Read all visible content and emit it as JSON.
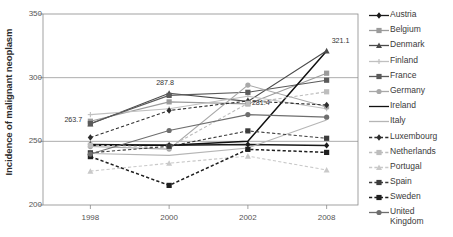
{
  "chart_data": {
    "type": "line",
    "title": "",
    "xlabel": "",
    "ylabel": "Incidence of malignant neoplasm",
    "categories": [
      "1998",
      "2000",
      "2002",
      "2008"
    ],
    "x_tick_labels": [
      "1998",
      "2000",
      "2002",
      "2008"
    ],
    "y_tick_labels": [
      "200",
      "250",
      "300",
      "350"
    ],
    "y_ticks": [
      200,
      250,
      300,
      350
    ],
    "ylim": [
      200,
      350
    ],
    "grid": true,
    "legend_position": "right",
    "annotations": [
      {
        "text": "263.7",
        "series": "Denmark",
        "x": "1998",
        "value": 263.7
      },
      {
        "text": "287.8",
        "series": "Denmark",
        "x": "2000",
        "value": 287.8
      },
      {
        "text": "281.4",
        "series": "Denmark",
        "x": "2002",
        "value": 281.4
      },
      {
        "text": "321.1",
        "series": "Denmark",
        "x": "2008",
        "value": 321.1
      }
    ],
    "series": [
      {
        "name": "Austria",
        "marker": "diamond",
        "dash": "solid",
        "color": "#1a1a1a",
        "values": [
          247.5,
          247.0,
          247.6,
          246.8
        ]
      },
      {
        "name": "Belgium",
        "marker": "square",
        "dash": "solid",
        "color": "#9b9b9b",
        "values": [
          265.8,
          281.0,
          279.4,
          303.5
        ]
      },
      {
        "name": "Denmark",
        "marker": "triangle",
        "dash": "solid",
        "color": "#4a4a4a",
        "values": [
          263.7,
          287.8,
          281.4,
          321.1
        ]
      },
      {
        "name": "Finland",
        "marker": "plus",
        "dash": "solid",
        "color": "#c0c0c0",
        "values": [
          271.0,
          275.6,
          285.4,
          275.6
        ]
      },
      {
        "name": "France",
        "marker": "square",
        "dash": "solid",
        "color": "#5a5a5a",
        "values": [
          264.0,
          286.1,
          288.5,
          298.0
        ]
      },
      {
        "name": "Germany",
        "marker": "circle",
        "dash": "solid",
        "color": "#a8a8a8",
        "values": [
          245.9,
          243.9,
          294.2,
          277.0
        ]
      },
      {
        "name": "Ireland",
        "marker": "none",
        "dash": "solid",
        "color": "#111111",
        "values": [
          247.0,
          247.0,
          250.0,
          321.0
        ]
      },
      {
        "name": "Italy",
        "marker": "none",
        "dash": "solid",
        "color": "#b5b5b5",
        "values": [
          240.5,
          239.0,
          244.8,
          266.8
        ]
      },
      {
        "name": "Luxembourg",
        "marker": "diamond",
        "dash": "dashed",
        "color": "#2e2e2e",
        "values": [
          253.0,
          274.2,
          281.7,
          278.5
        ]
      },
      {
        "name": "Netherlands",
        "marker": "square",
        "dash": "dashed",
        "color": "#bdbdbd",
        "values": [
          247.0,
          245.4,
          279.9,
          288.9
        ]
      },
      {
        "name": "Portugal",
        "marker": "triangle",
        "dash": "dashed",
        "color": "#c9c9c9",
        "values": [
          226.6,
          232.8,
          238.4,
          227.5
        ]
      },
      {
        "name": "Spain",
        "marker": "square",
        "dash": "dashed",
        "color": "#3c3c3c",
        "values": [
          241.0,
          246.1,
          258.2,
          252.4
        ]
      },
      {
        "name": "Sweden",
        "marker": "square",
        "dash": "dashed",
        "color": "#1f1f1f",
        "values": [
          238.0,
          215.4,
          243.7,
          241.3
        ]
      },
      {
        "name": "United Kingdom",
        "marker": "circle",
        "dash": "solid",
        "color": "#6e6e6e",
        "values": [
          240.0,
          258.5,
          271.0,
          269.0
        ]
      }
    ]
  },
  "legend": {
    "items": [
      {
        "label": "Austria"
      },
      {
        "label": "Belgium"
      },
      {
        "label": "Denmark"
      },
      {
        "label": "Finland"
      },
      {
        "label": "France"
      },
      {
        "label": "Germany"
      },
      {
        "label": "Ireland"
      },
      {
        "label": "Italy"
      },
      {
        "label": "Luxembourg"
      },
      {
        "label": "Netherlands"
      },
      {
        "label": "Portugal"
      },
      {
        "label": "Spain"
      },
      {
        "label": "Sweden"
      },
      {
        "label": "United\nKingdom"
      }
    ]
  }
}
